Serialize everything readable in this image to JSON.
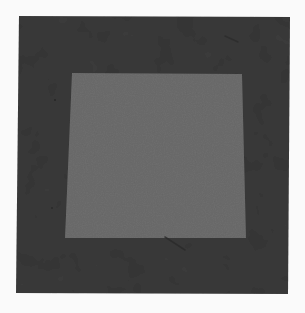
{
  "image": {
    "width": 305,
    "height": 313,
    "background": "#fafafa"
  },
  "artwork": {
    "description": "Abstract painting: dark textured square field with a lighter gray inset quadrilateral",
    "outer_field": {
      "color": "#3b3b3b",
      "points": [
        [
          19,
          16
        ],
        [
          290,
          17
        ],
        [
          288,
          294
        ],
        [
          16,
          293
        ]
      ]
    },
    "inner_square": {
      "color": "#6f6f6f",
      "points": [
        [
          72,
          73
        ],
        [
          242,
          74
        ],
        [
          246,
          238
        ],
        [
          65,
          238
        ]
      ]
    },
    "marks": [
      {
        "type": "streak",
        "color": "#2a2a2a",
        "from": [
          165,
          237
        ],
        "to": [
          185,
          250
        ]
      },
      {
        "type": "streak",
        "color": "#2c2c2c",
        "from": [
          225,
          36
        ],
        "to": [
          238,
          42
        ]
      },
      {
        "type": "speck",
        "color": "#262626",
        "at": [
          55,
          100
        ]
      },
      {
        "type": "speck",
        "color": "#2a2a2a",
        "at": [
          52,
          208
        ]
      }
    ]
  }
}
